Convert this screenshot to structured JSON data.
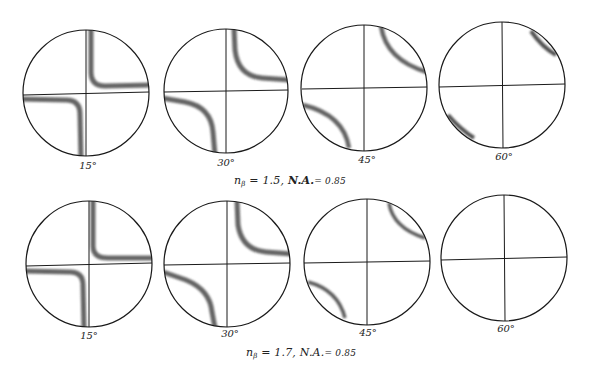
{
  "figure": {
    "rows": [
      {
        "caption": {
          "symbol": "n",
          "subscript": "β",
          "eq": "= 1.5,",
          "na_label": "N.A.",
          "na_eq": "= 0.85",
          "full": "nβ = 1.5, N.A. = 0.85"
        },
        "panels": [
          {
            "label": "15°",
            "angle": 15,
            "cx": 86,
            "cy": 93,
            "r": 63,
            "isogyre": "cross-near-center"
          },
          {
            "label": "30°",
            "angle": 30,
            "cx": 226,
            "cy": 91,
            "r": 62,
            "isogyre": "hyperbola-moderate"
          },
          {
            "label": "45°",
            "angle": 45,
            "cx": 364,
            "cy": 88,
            "r": 63,
            "isogyre": "hyperbola-wide"
          },
          {
            "label": "60°",
            "angle": 60,
            "cx": 502,
            "cy": 85,
            "r": 63,
            "isogyre": "edge-arcs"
          }
        ]
      },
      {
        "caption": {
          "symbol": "n",
          "subscript": "β",
          "eq": "= 1.7,",
          "na_label": "N.A.",
          "na_eq": "= 0.85",
          "full": "nβ = 1.7, N.A. = 0.85"
        },
        "panels": [
          {
            "label": "15°",
            "angle": 15,
            "cx": 89,
            "cy": 264,
            "r": 63,
            "isogyre": "cross-near-center"
          },
          {
            "label": "30°",
            "angle": 30,
            "cx": 227,
            "cy": 264,
            "r": 63,
            "isogyre": "hyperbola-moderate"
          },
          {
            "label": "45°",
            "angle": 45,
            "cx": 367,
            "cy": 262,
            "r": 63,
            "isogyre": "hyperbola-edge"
          },
          {
            "label": "60°",
            "angle": 60,
            "cx": 504,
            "cy": 258,
            "r": 63,
            "isogyre": "none"
          }
        ]
      }
    ],
    "colors": {
      "outline": "#1a1a1a",
      "isogyre": "#555555",
      "background": "#ffffff"
    }
  }
}
